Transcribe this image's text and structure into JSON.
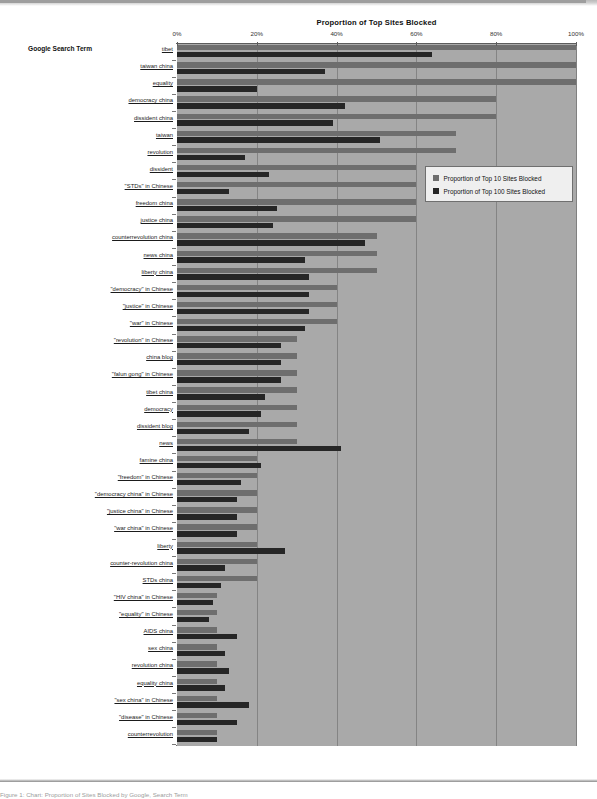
{
  "figure": {
    "title": "Proportion of Top Sites Blocked",
    "category_axis_title": "Google Search Term",
    "caption": "Figure 1: Chart: Proportion of Sites Blocked by Google, Search Term"
  },
  "legend": {
    "items": [
      {
        "label": "Proportion of Top 10 Sites Blocked",
        "color": "#6e6e6e",
        "icon": "legend-swatch-icon"
      },
      {
        "label": "Proportion of Top 100 Sites Blocked",
        "color": "#262626",
        "icon": "legend-swatch-icon"
      }
    ]
  },
  "chart_data": {
    "type": "bar",
    "orientation": "horizontal",
    "title": "Proportion of Top Sites Blocked",
    "xlabel": "Proportion of Top Sites Blocked",
    "ylabel": "Google Search Term",
    "xlim": [
      0,
      100
    ],
    "xunit": "%",
    "xticks": [
      0,
      20,
      40,
      60,
      80,
      100
    ],
    "xticklabels": [
      "0%",
      "20%",
      "40%",
      "60%",
      "80%",
      "100%"
    ],
    "grid": true,
    "legend_position": "upper-right-inside",
    "categories": [
      "tibet",
      "taiwan china",
      "equality",
      "democracy china",
      "dissident china",
      "taiwan",
      "revolution",
      "dissident",
      "\"STDs\" in Chinese",
      "freedom china",
      "justice china",
      "counterrevolution china",
      "news china",
      "liberty china",
      "\"democracy\" in Chinese",
      "\"justice\" in Chinese",
      "\"war\" in Chinese",
      "\"revolution\" in Chinese",
      "china blog",
      "\"falun gong\" in Chinese",
      "tibet china",
      "democracy",
      "dissident blog",
      "news",
      "famine china",
      "\"freedom\" in Chinese",
      "\"democracy china\" in Chinese",
      "\"justice china\" in Chinese",
      "\"war china\" in Chinese",
      "liberty",
      "counter-revolution china",
      "STDs china",
      "\"HIV china\" in Chinese",
      "\"equality\" in Chinese",
      "AIDS china",
      "sex china",
      "revolution china",
      "equality china",
      "\"sex china\" in Chinese",
      "\"disease\" in Chinese",
      "counterrevolution"
    ],
    "series": [
      {
        "name": "Proportion of Top 10 Sites Blocked",
        "color": "#6e6e6e",
        "values": [
          100,
          100,
          100,
          80,
          80,
          70,
          70,
          60,
          60,
          60,
          60,
          50,
          50,
          50,
          40,
          40,
          40,
          30,
          30,
          30,
          30,
          30,
          30,
          30,
          20,
          20,
          20,
          20,
          20,
          20,
          20,
          20,
          10,
          10,
          10,
          10,
          10,
          10,
          10,
          10,
          10
        ]
      },
      {
        "name": "Proportion of Top 100 Sites Blocked",
        "color": "#262626",
        "values": [
          64,
          37,
          20,
          42,
          39,
          51,
          17,
          23,
          13,
          25,
          24,
          47,
          32,
          33,
          33,
          33,
          32,
          26,
          26,
          26,
          22,
          21,
          18,
          41,
          21,
          16,
          15,
          15,
          15,
          27,
          12,
          11,
          9,
          8,
          15,
          12,
          13,
          12,
          18,
          15,
          10
        ]
      }
    ]
  }
}
